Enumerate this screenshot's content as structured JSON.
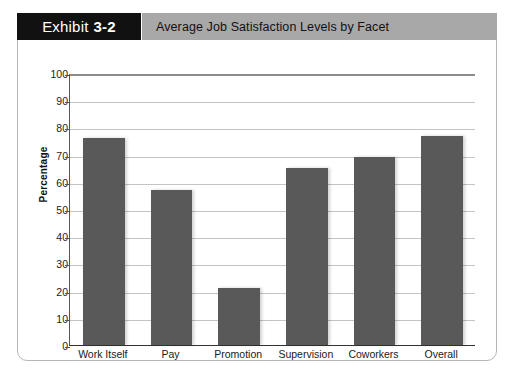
{
  "exhibit": {
    "tag_word": "Exhibit",
    "tag_number": "3-2",
    "title": "Average Job Satisfaction Levels by Facet"
  },
  "colors": {
    "bar_fill": "#595959",
    "tag_background": "#111111",
    "title_background": "#a8a8a8",
    "gridline": "#c4c4c4",
    "card_border": "#b6b6b6"
  },
  "chart_data": {
    "type": "bar",
    "title": "Average Job Satisfaction Levels by Facet",
    "xlabel": "",
    "ylabel": "Percentage",
    "categories": [
      "Work Itself",
      "Pay",
      "Promotion",
      "Supervision",
      "Coworkers",
      "Overall"
    ],
    "values": [
      76,
      57,
      21,
      65,
      69,
      77
    ],
    "ylim": [
      0,
      100
    ],
    "ytick_labels": [
      "0",
      "10",
      "20",
      "30",
      "40",
      "50",
      "60",
      "70",
      "80",
      "90",
      "100"
    ],
    "ytick_values": [
      0,
      10,
      20,
      30,
      40,
      50,
      60,
      70,
      80,
      90,
      100
    ],
    "grid": true,
    "legend": null
  }
}
